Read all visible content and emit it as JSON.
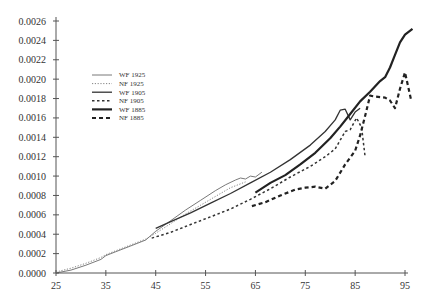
{
  "chart_data": {
    "type": "line",
    "title": "",
    "xlabel": "",
    "ylabel": "",
    "xlim": [
      25,
      97
    ],
    "ylim": [
      0,
      0.0026
    ],
    "x_ticks": [
      "25",
      "35",
      "45",
      "55",
      "65",
      "75",
      "85",
      "95"
    ],
    "y_ticks": [
      "0.0000",
      "0.0002",
      "0.0004",
      "0.0006",
      "0.0008",
      "0.0010",
      "0.0012",
      "0.0014",
      "0.0016",
      "0.0018",
      "0.0020",
      "0.0022",
      "0.0024",
      "0.0026"
    ],
    "grid": false,
    "legend_position": "upper-left",
    "series": [
      {
        "name": "WF 1925",
        "style": "thin-solid",
        "x": [
          25,
          28,
          31,
          34,
          35,
          37,
          40,
          43,
          45,
          48,
          51,
          54,
          57,
          59,
          61,
          62,
          63,
          64,
          65,
          66.3
        ],
        "y": [
          0.0,
          3e-05,
          8e-05,
          0.00014,
          0.00018,
          0.00022,
          0.00028,
          0.00034,
          0.00043,
          0.00054,
          0.00065,
          0.00075,
          0.00085,
          0.00091,
          0.00096,
          0.00098,
          0.00097,
          0.001,
          0.00099,
          0.00104
        ]
      },
      {
        "name": "NF 1925",
        "style": "dotted-thin",
        "x": [
          25,
          28,
          31,
          34,
          35,
          37,
          40,
          43,
          45,
          48,
          51,
          54,
          57,
          60,
          63
        ],
        "y": [
          1e-05,
          5e-05,
          0.0001,
          0.00016,
          0.00019,
          0.00023,
          0.00029,
          0.00035,
          0.00041,
          0.00051,
          0.00061,
          0.0007,
          0.00079,
          0.00088,
          0.00094
        ]
      },
      {
        "name": "WF 1905",
        "style": "medium-solid",
        "x": [
          45,
          48,
          52,
          56,
          60,
          64,
          68,
          72,
          76,
          79,
          81,
          82,
          83,
          84,
          85,
          86
        ],
        "y": [
          0.00046,
          0.00053,
          0.00062,
          0.00072,
          0.00082,
          0.00093,
          0.00104,
          0.00117,
          0.00132,
          0.00146,
          0.00158,
          0.00168,
          0.00169,
          0.00158,
          0.00166,
          0.0017
        ]
      },
      {
        "name": "NF 1905",
        "style": "dash-dot",
        "x": [
          44.2,
          48,
          52,
          56,
          60,
          64,
          68,
          72,
          76,
          79,
          81,
          83,
          84,
          85.3,
          86.3,
          87
        ],
        "y": [
          0.00036,
          0.00042,
          0.0005,
          0.00058,
          0.00066,
          0.00076,
          0.00087,
          0.00099,
          0.0011,
          0.0012,
          0.00128,
          0.00146,
          0.00148,
          0.0016,
          0.0015,
          0.0012
        ]
      },
      {
        "name": "WF 1885",
        "style": "thick-solid",
        "x": [
          65,
          68,
          71,
          74,
          77,
          80,
          82,
          84,
          86,
          88,
          90,
          91,
          92,
          93,
          94,
          95,
          96.5
        ],
        "y": [
          0.00083,
          0.00093,
          0.00101,
          0.00112,
          0.00124,
          0.00139,
          0.00151,
          0.00164,
          0.00177,
          0.00187,
          0.00198,
          0.00202,
          0.00212,
          0.00225,
          0.00238,
          0.00246,
          0.00252
        ]
      },
      {
        "name": "NF 1885",
        "style": "thick-dashed",
        "x": [
          64.3,
          67,
          70,
          73,
          75,
          77,
          79,
          81,
          83,
          85,
          86,
          87,
          88,
          89,
          91,
          92,
          93,
          94,
          95,
          96.2
        ],
        "y": [
          0.00069,
          0.00073,
          0.0008,
          0.00086,
          0.00088,
          0.00089,
          0.00087,
          0.00095,
          0.00112,
          0.00126,
          0.00142,
          0.00162,
          0.00183,
          0.00182,
          0.00181,
          0.00178,
          0.0017,
          0.0019,
          0.00207,
          0.00179
        ]
      }
    ]
  }
}
